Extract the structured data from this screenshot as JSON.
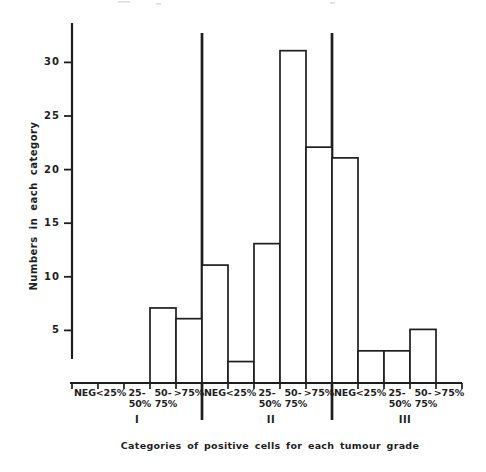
{
  "figure": {
    "background": "#ffffff",
    "ink": "#1e1e1e",
    "scan_artifact_color": "#cfcfcf"
  },
  "chart_data": {
    "type": "bar",
    "xlabel": "Categories of positive cells for each tumour grade",
    "ylabel": "Numbers in each category",
    "ylim": [
      0,
      33
    ],
    "yticks": [
      5,
      10,
      15,
      20,
      25,
      30
    ],
    "grid": false,
    "bar_style": "outlined-white",
    "categories": [
      "NEG",
      "<25%",
      "25-50%",
      "50-75%",
      ">75%"
    ],
    "category_display_lines": [
      [
        "NEG"
      ],
      [
        "<25%"
      ],
      [
        "25-",
        "50%"
      ],
      [
        "50-",
        "75%"
      ],
      [
        ">75%"
      ]
    ],
    "groups": [
      {
        "label": "I",
        "values": [
          0,
          0,
          0,
          7,
          6
        ]
      },
      {
        "label": "II",
        "values": [
          11,
          2,
          13,
          31,
          22
        ]
      },
      {
        "label": "III",
        "values": [
          21,
          3,
          3,
          5,
          0
        ]
      }
    ]
  }
}
